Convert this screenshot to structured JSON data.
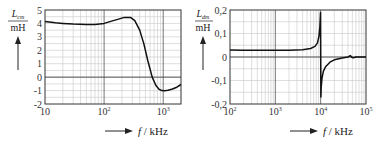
{
  "chart_data": [
    {
      "type": "line",
      "id": "left",
      "title": "",
      "ylabel_symbol": "L",
      "ylabel_subscript": "cm",
      "ylabel_unit": "mH",
      "xlabel_symbol": "f",
      "xlabel_unit": "kHz",
      "xscale": "log",
      "xlim": [
        10,
        2000
      ],
      "ylim": [
        -2,
        5
      ],
      "grid": true,
      "x_ticks": [
        {
          "base": "10",
          "exp": ""
        },
        {
          "base": "10",
          "exp": "2"
        },
        {
          "base": "10",
          "exp": "3"
        }
      ],
      "y_ticks": [
        "5",
        "4",
        "3",
        "2",
        "1",
        "0",
        "-1",
        "-2"
      ],
      "series": [
        {
          "name": "L_cm",
          "x": [
            10,
            15,
            20,
            30,
            50,
            70,
            100,
            130,
            170,
            220,
            280,
            330,
            400,
            470,
            550,
            650,
            750,
            850,
            950,
            1050,
            1200,
            1400,
            1700,
            2000
          ],
          "y": [
            4.15,
            4.05,
            4.0,
            3.95,
            3.92,
            3.93,
            4.0,
            4.15,
            4.3,
            4.45,
            4.45,
            4.2,
            3.5,
            2.5,
            1.2,
            0.0,
            -0.6,
            -0.9,
            -1.0,
            -1.02,
            -0.98,
            -0.9,
            -0.75,
            -0.55
          ]
        }
      ]
    },
    {
      "type": "line",
      "id": "right",
      "title": "",
      "ylabel_symbol": "L",
      "ylabel_subscript": "dm",
      "ylabel_unit": "mH",
      "xlabel_symbol": "f",
      "xlabel_unit": "kHz",
      "xscale": "log",
      "xlim": [
        100,
        100000
      ],
      "ylim": [
        -0.2,
        0.2
      ],
      "grid": true,
      "x_ticks": [
        {
          "base": "10",
          "exp": "2"
        },
        {
          "base": "10",
          "exp": "3"
        },
        {
          "base": "10",
          "exp": "4"
        },
        {
          "base": "10",
          "exp": "5"
        }
      ],
      "y_ticks": [
        "0,2",
        "0,1",
        "0",
        "-0,1",
        "-0,2"
      ],
      "series": [
        {
          "name": "L_dm",
          "x": [
            100,
            200,
            500,
            1000,
            2000,
            4000,
            6000,
            7500,
            8500,
            9200,
            9600,
            9800,
            9900,
            10000,
            10100,
            10300,
            10700,
            11500,
            13000,
            16000,
            20000,
            30000,
            40000,
            45000,
            48000,
            52000,
            60000,
            100000
          ],
          "y": [
            0.03,
            0.029,
            0.029,
            0.029,
            0.029,
            0.031,
            0.036,
            0.045,
            0.06,
            0.09,
            0.13,
            0.17,
            0.19,
            0.0,
            -0.17,
            -0.13,
            -0.09,
            -0.06,
            -0.04,
            -0.022,
            -0.012,
            -0.004,
            0.0,
            0.006,
            0.0,
            -0.004,
            0.0,
            0.0
          ]
        }
      ]
    }
  ],
  "labels": {
    "left_ylabel_symbol": "L",
    "left_ylabel_sub": "cm",
    "left_ylabel_unit": "mH",
    "right_ylabel_symbol": "L",
    "right_ylabel_sub": "dm",
    "right_ylabel_unit": "mH",
    "xlabel_symbol": "f",
    "xlabel_unit": "/ kHz"
  }
}
